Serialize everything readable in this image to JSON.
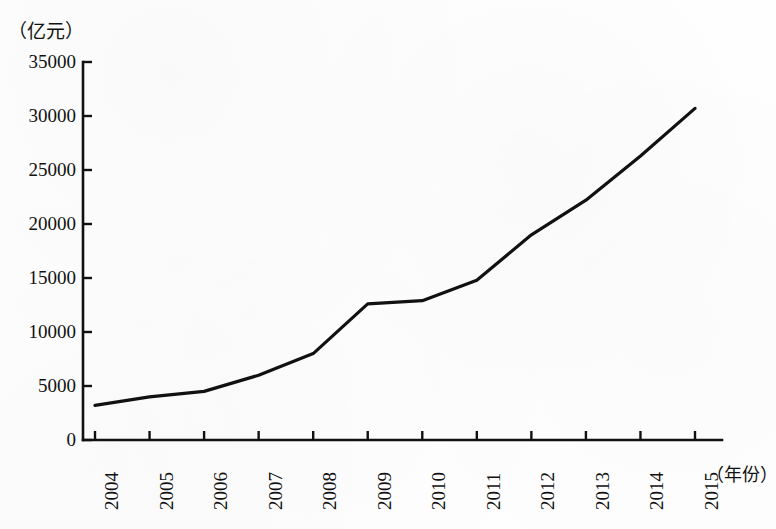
{
  "chart_data": {
    "type": "line",
    "title": "",
    "subtitle": "",
    "xlabel": "（年份）",
    "ylabel": "（亿元）",
    "categories": [
      "2004",
      "2005",
      "2006",
      "2007",
      "2008",
      "2009",
      "2010",
      "2011",
      "2012",
      "2013",
      "2014",
      "2015"
    ],
    "values": [
      3200,
      4000,
      4500,
      6000,
      8000,
      12600,
      12900,
      14800,
      19000,
      22200,
      26300,
      30700
    ],
    "series": [
      {
        "name": "",
        "values": [
          3200,
          4000,
          4500,
          6000,
          8000,
          12600,
          12900,
          14800,
          19000,
          22200,
          26300,
          30700
        ]
      }
    ],
    "ylim": [
      0,
      35000
    ],
    "yticks": [
      0,
      5000,
      10000,
      15000,
      20000,
      25000,
      30000,
      35000
    ],
    "ytick_labels": [
      "0",
      "5000",
      "10000",
      "15000",
      "20000",
      "25000",
      "30000",
      "35000"
    ],
    "xtick_labels": [
      "2004",
      "2005",
      "2006",
      "2007",
      "2008",
      "2009",
      "2010",
      "2011",
      "2012",
      "2013",
      "2014",
      "2015"
    ],
    "grid": false,
    "legend": "none",
    "line_color": "#111111",
    "line_width": 3.2,
    "axis_color": "#111111",
    "background_color": "#fefefe",
    "xtick_rotation": -90
  },
  "axes": {
    "y_unit_label": "（亿元）",
    "x_unit_label": "（年份）"
  }
}
